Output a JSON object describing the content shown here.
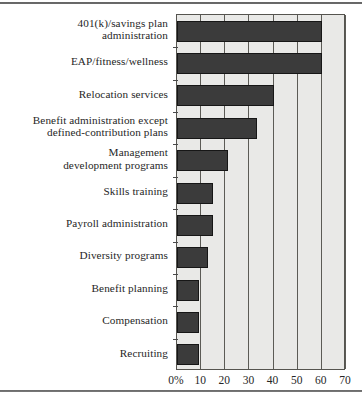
{
  "chart_data": {
    "type": "bar",
    "orientation": "horizontal",
    "title": "",
    "subtitle": "",
    "xlabel": "",
    "ylabel": "",
    "xlim": [
      0,
      70
    ],
    "ylim": null,
    "grid": true,
    "legend": null,
    "legend_position": "none",
    "xticks": [
      0,
      10,
      20,
      30,
      40,
      50,
      60,
      70
    ],
    "xtick_labels": [
      "0%",
      "10",
      "20",
      "30",
      "40",
      "50",
      "60",
      "70"
    ],
    "categories": [
      "401(k)/savings plan administration",
      "EAP/fitness/wellness",
      "Relocation services",
      "Benefit administration except defined-contribution plans",
      "Management development programs",
      "Skills training",
      "Payroll administration",
      "Diversity programs",
      "Benefit planning",
      "Compensation",
      "Recruiting"
    ],
    "values": [
      60,
      60,
      40,
      33,
      21,
      15,
      15,
      13,
      9,
      9,
      9
    ],
    "bar_color": "#3b3b3b",
    "plot_background": "#e9e9e7",
    "frame_color": "#55544f"
  },
  "axis": {
    "tick_labels": [
      "0%",
      "10",
      "20",
      "30",
      "40",
      "50",
      "60",
      "70"
    ]
  },
  "category_labels": [
    {
      "line1": "401(k)/savings plan",
      "line2": "administration"
    },
    {
      "line1": "EAP/fitness/wellness",
      "line2": ""
    },
    {
      "line1": "Relocation services",
      "line2": ""
    },
    {
      "line1": "Benefit administration except",
      "line2": "defined-contribution plans"
    },
    {
      "line1": "Management",
      "line2": "development programs"
    },
    {
      "line1": "Skills training",
      "line2": ""
    },
    {
      "line1": "Payroll administration",
      "line2": ""
    },
    {
      "line1": "Diversity programs",
      "line2": ""
    },
    {
      "line1": "Benefit planning",
      "line2": ""
    },
    {
      "line1": "Compensation",
      "line2": ""
    },
    {
      "line1": "Recruiting",
      "line2": ""
    }
  ]
}
